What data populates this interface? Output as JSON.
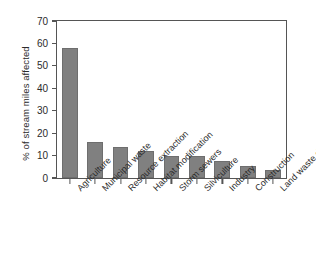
{
  "chart_data": {
    "type": "bar",
    "title": "",
    "xlabel": "",
    "ylabel": "% of stream miles affected",
    "categories": [
      "Agriculture",
      "Municipal waste",
      "Resource extraction",
      "Habitat modification",
      "Storm sewers",
      "Silviculture",
      "Industry",
      "Construction",
      "Land waste disposal"
    ],
    "values": [
      58,
      16,
      14,
      12,
      10,
      10,
      7.5,
      5.5,
      3.5
    ],
    "ylim": [
      0,
      70
    ],
    "yticks": [
      0,
      10,
      20,
      30,
      40,
      50,
      60,
      70
    ],
    "ytick_labels": [
      "0",
      "10",
      "20",
      "30",
      "40",
      "50",
      "60",
      "70"
    ],
    "grid": false,
    "legend": null,
    "bar_color": "#808080",
    "frame_color": "#555555",
    "background": "#ffffff"
  }
}
